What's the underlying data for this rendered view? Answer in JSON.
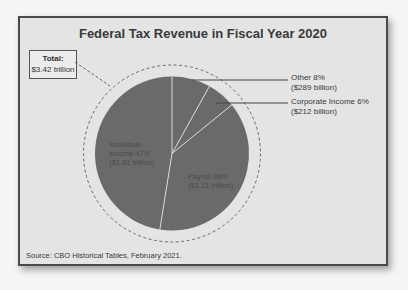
{
  "chart_data": {
    "type": "pie",
    "title": "Federal Tax Revenue in Fiscal Year 2020",
    "total_label": "Total:",
    "total_value": "$3.42 trillion",
    "slices": [
      {
        "name": "Other",
        "percent": 8,
        "amount": "$289 billion",
        "label_line1": "Other 8%",
        "label_line2": "($289 billion)",
        "color": "#6a6a6a"
      },
      {
        "name": "Corporate Income",
        "percent": 6,
        "amount": "$212 billion",
        "label_line1": "Corporate Income 6%",
        "label_line2": "($212 billion)",
        "color": "#6a6a6a"
      },
      {
        "name": "Payroll",
        "percent": 38,
        "amount": "$1.21 trillion",
        "label_line1": "Payroll 38%",
        "label_line2": "($1.21 trillion)",
        "color": "#6a6a6a"
      },
      {
        "name": "Individual Income",
        "percent": 47,
        "amount": "$1.61 trillion",
        "label_line1": "Individual",
        "label_line2": "income 47%",
        "label_line3": "($1.61 trillion)",
        "color": "#6a6a6a"
      }
    ],
    "source": "Source: CBO Historical Tables, February 2021."
  },
  "colors": {
    "slice": "#6a6a6a",
    "divider": "#d8d8d8",
    "frame_bg": "#e4e4e4",
    "frame_border": "#4a4a4a",
    "text": "#3a3a3a"
  }
}
